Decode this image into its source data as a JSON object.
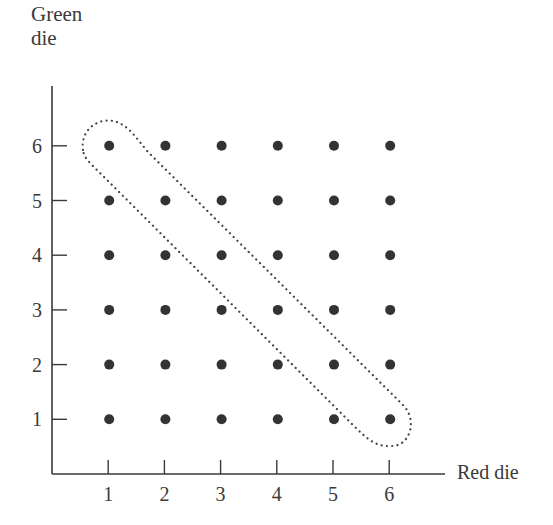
{
  "chart_data": {
    "type": "scatter",
    "title": "",
    "xlabel": "Red die",
    "ylabel": "Green die",
    "ylabel_lines": [
      "Green",
      "die"
    ],
    "x_ticks": [
      1,
      2,
      3,
      4,
      5,
      6
    ],
    "y_ticks": [
      1,
      2,
      3,
      4,
      5,
      6
    ],
    "xlim": [
      0,
      6.8
    ],
    "ylim": [
      0,
      6.8
    ],
    "grid": false,
    "legend": null,
    "points": [
      [
        1,
        1
      ],
      [
        2,
        1
      ],
      [
        3,
        1
      ],
      [
        4,
        1
      ],
      [
        5,
        1
      ],
      [
        6,
        1
      ],
      [
        1,
        2
      ],
      [
        2,
        2
      ],
      [
        3,
        2
      ],
      [
        4,
        2
      ],
      [
        5,
        2
      ],
      [
        6,
        2
      ],
      [
        1,
        3
      ],
      [
        2,
        3
      ],
      [
        3,
        3
      ],
      [
        4,
        3
      ],
      [
        5,
        3
      ],
      [
        6,
        3
      ],
      [
        1,
        4
      ],
      [
        2,
        4
      ],
      [
        3,
        4
      ],
      [
        4,
        4
      ],
      [
        5,
        4
      ],
      [
        6,
        4
      ],
      [
        1,
        5
      ],
      [
        2,
        5
      ],
      [
        3,
        5
      ],
      [
        4,
        5
      ],
      [
        5,
        5
      ],
      [
        6,
        5
      ],
      [
        1,
        6
      ],
      [
        2,
        6
      ],
      [
        3,
        6
      ],
      [
        4,
        6
      ],
      [
        5,
        6
      ],
      [
        6,
        6
      ]
    ],
    "annotations": [
      {
        "type": "dotted-loop",
        "description": "Dotted outline enclosing the anti-diagonal outcomes where red + green = 7",
        "encloses": [
          [
            1,
            6
          ],
          [
            2,
            5
          ],
          [
            3,
            4
          ],
          [
            4,
            3
          ],
          [
            5,
            2
          ],
          [
            6,
            1
          ]
        ]
      }
    ]
  },
  "colors": {
    "axis": "#3a3a3a",
    "point": "#333333",
    "loop": "#444444"
  }
}
